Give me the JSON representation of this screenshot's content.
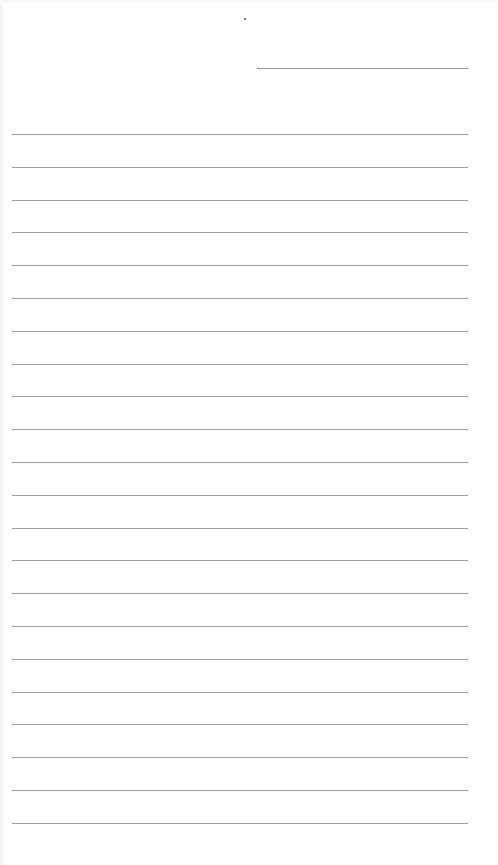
{
  "document": {
    "type": "lined-paper-form",
    "background_color": "#ffffff",
    "rule_color": "#9e9e9e",
    "header": {
      "date_line": {
        "x_start": 257,
        "x_end": 468,
        "y": 68,
        "text": ""
      },
      "speck": {
        "x": 244,
        "y": 18
      }
    },
    "ruled_lines": {
      "count": 22,
      "x_start": 12,
      "x_end": 468,
      "first_y": 134,
      "spacing": 32.8,
      "lines": [
        "",
        "",
        "",
        "",
        "",
        "",
        "",
        "",
        "",
        "",
        "",
        "",
        "",
        "",
        "",
        "",
        "",
        "",
        "",
        "",
        "",
        ""
      ]
    }
  }
}
